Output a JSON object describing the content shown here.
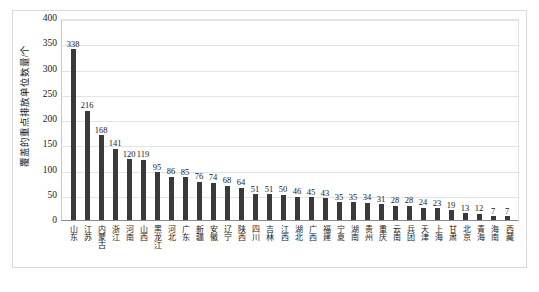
{
  "chart_data": {
    "type": "bar",
    "title": "",
    "xlabel": "",
    "ylabel": "覆盖的重点排放单位数量/个",
    "ylim": [
      0,
      400
    ],
    "ytick_step": 50,
    "yticks": [
      "400",
      "350",
      "300",
      "250",
      "200",
      "150",
      "100",
      "50",
      "0"
    ],
    "grid": true,
    "legend": "none",
    "bar_color": "#3a3a3a",
    "categories": [
      "山东",
      "江苏",
      "内蒙古",
      "浙江",
      "河南",
      "山西",
      "黑龙江",
      "河北",
      "广东",
      "新疆",
      "安徽",
      "辽宁",
      "陕西",
      "四川",
      "吉林",
      "江西",
      "湖北",
      "广西",
      "福建",
      "宁夏",
      "湖南",
      "贵州",
      "重庆",
      "云南",
      "兵团",
      "天津",
      "上海",
      "甘肃",
      "北京",
      "青海",
      "海南",
      "西藏"
    ],
    "values": [
      338,
      216,
      168,
      141,
      120,
      119,
      95,
      86,
      85,
      76,
      74,
      68,
      64,
      51,
      51,
      50,
      46,
      45,
      43,
      35,
      35,
      34,
      31,
      28,
      28,
      24,
      23,
      19,
      13,
      12,
      7,
      7
    ]
  },
  "caption": {
    "text": ""
  }
}
